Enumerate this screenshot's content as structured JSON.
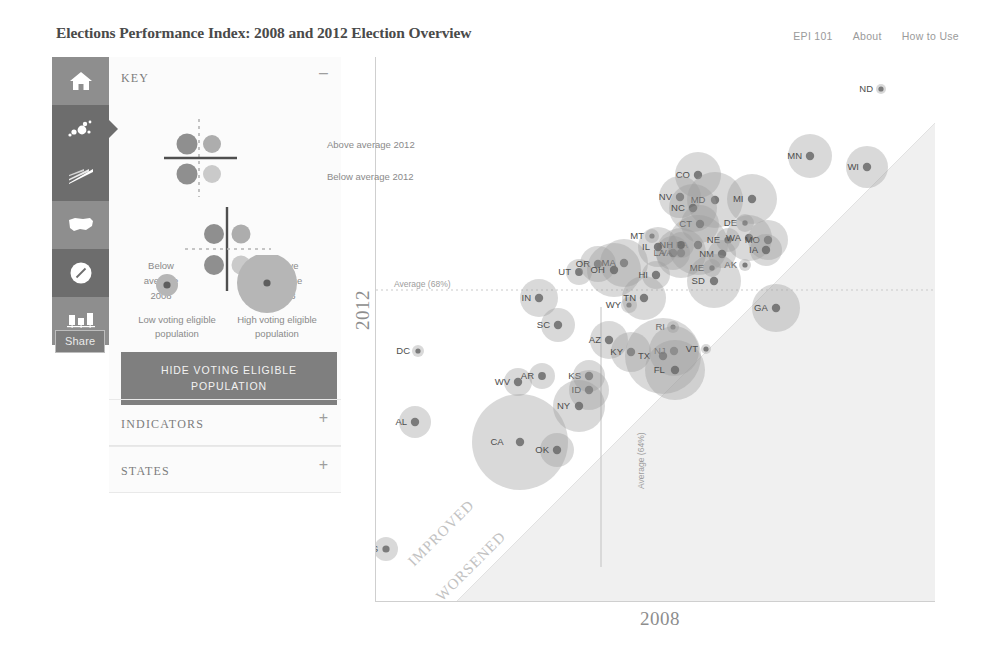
{
  "header": {
    "title": "Elections Performance Index: 2008 and 2012 Election Overview",
    "nav": [
      {
        "label": "EPI 101"
      },
      {
        "label": "About"
      },
      {
        "label": "How to Use"
      }
    ]
  },
  "sidebar": {
    "share_label": "Share",
    "items": [
      {
        "icon": "home-icon",
        "active": false
      },
      {
        "icon": "bubble-chart-icon",
        "active": true
      },
      {
        "icon": "slope-chart-icon",
        "active": true
      },
      {
        "icon": "us-map-icon",
        "active": false
      },
      {
        "icon": "dial-gauge-icon",
        "active": false
      },
      {
        "icon": "bar-chart-icon",
        "active": false
      }
    ]
  },
  "panel": {
    "key": {
      "title": "KEY",
      "toggle": "–",
      "quadrant_labels": {
        "above_2012": "Above average 2012",
        "below_2012": "Below average 2012",
        "below_2008": "Below average 2008",
        "above_2008": "Above average 2008"
      },
      "size_labels": {
        "low": "Low voting eligible population",
        "high": "High voting eligible population"
      },
      "hide_button": "HIDE VOTING ELIGIBLE POPULATION"
    },
    "indicators": {
      "title": "INDICATORS",
      "toggle": "+"
    },
    "states": {
      "title": "STATES",
      "toggle": "+"
    }
  },
  "chart_data": {
    "type": "scatter",
    "title": "Elections Performance Index: 2008 and 2012 Election Overview",
    "xlabel": "2008",
    "ylabel": "2012",
    "xlim": [
      40,
      100
    ],
    "ylim": [
      40,
      100
    ],
    "grid": false,
    "averages": {
      "x_label": "Average (64%)",
      "x_value": 64,
      "y_label": "Average (68%)",
      "y_value": 68
    },
    "annotations": [
      {
        "text": "IMPROVED",
        "position": "above-diagonal"
      },
      {
        "text": "WORSENED",
        "position": "below-diagonal"
      }
    ],
    "size_encoding": "voting eligible population",
    "colors": {
      "bubble_fill": "#9a9a9a",
      "bubble_core": "#6a6a6a",
      "axis": "#cfcfcf",
      "average_line": "#c9c9c9",
      "worsened_region": "#efefef",
      "panel_accent": "#7f7f7f"
    },
    "points": [
      {
        "label": "ND",
        "x": 880,
        "y": 89,
        "r": 5,
        "size": 1
      },
      {
        "label": "MN",
        "x": 809,
        "y": 156,
        "r": 22,
        "size": 5
      },
      {
        "label": "WI",
        "x": 866,
        "y": 167,
        "r": 21,
        "size": 5
      },
      {
        "label": "CO",
        "x": 697,
        "y": 175,
        "r": 23,
        "size": 5
      },
      {
        "label": "NV",
        "x": 679,
        "y": 197,
        "r": 21,
        "size": 4
      },
      {
        "label": "MD",
        "x": 714,
        "y": 200,
        "r": 28,
        "size": 6
      },
      {
        "label": "MI",
        "x": 751,
        "y": 199,
        "r": 25,
        "size": 6
      },
      {
        "label": "NC",
        "x": 692,
        "y": 208,
        "r": 24,
        "size": 6
      },
      {
        "label": "CT",
        "x": 699,
        "y": 224,
        "r": 19,
        "size": 4
      },
      {
        "label": "DE",
        "x": 744,
        "y": 223,
        "r": 9,
        "size": 2
      },
      {
        "label": "MT",
        "x": 651,
        "y": 236,
        "r": 7,
        "size": 1
      },
      {
        "label": "PA",
        "x": 697,
        "y": 245,
        "r": 30,
        "size": 7
      },
      {
        "label": "NE",
        "x": 727,
        "y": 240,
        "r": 12,
        "size": 3
      },
      {
        "label": "WA",
        "x": 748,
        "y": 238,
        "r": 23,
        "size": 5
      },
      {
        "label": "MO",
        "x": 767,
        "y": 240,
        "r": 20,
        "size": 5
      },
      {
        "label": "VA",
        "x": 680,
        "y": 253,
        "r": 25,
        "size": 6
      },
      {
        "label": "NM",
        "x": 721,
        "y": 254,
        "r": 14,
        "size": 3
      },
      {
        "label": "IA",
        "x": 765,
        "y": 250,
        "r": 16,
        "size": 4
      },
      {
        "label": "AK",
        "x": 744,
        "y": 265,
        "r": 6,
        "size": 1
      },
      {
        "label": "ME",
        "x": 711,
        "y": 268,
        "r": 9,
        "size": 2
      },
      {
        "label": "SD",
        "x": 713,
        "y": 281,
        "r": 27,
        "size": 6
      },
      {
        "label": "UT",
        "x": 578,
        "y": 272,
        "r": 13,
        "size": 3
      },
      {
        "label": "OR",
        "x": 597,
        "y": 264,
        "r": 18,
        "size": 4
      },
      {
        "label": "MA",
        "x": 623,
        "y": 263,
        "r": 24,
        "size": 6
      },
      {
        "label": "OH",
        "x": 613,
        "y": 270,
        "r": 27,
        "size": 6
      },
      {
        "label": "IN",
        "x": 538,
        "y": 298,
        "r": 19,
        "size": 4
      },
      {
        "label": "WY",
        "x": 628,
        "y": 305,
        "r": 8,
        "size": 2
      },
      {
        "label": "TN",
        "x": 643,
        "y": 298,
        "r": 22,
        "size": 5
      },
      {
        "label": "GA",
        "x": 775,
        "y": 308,
        "r": 24,
        "size": 6
      },
      {
        "label": "SC",
        "x": 557,
        "y": 325,
        "r": 17,
        "size": 4
      },
      {
        "label": "RI",
        "x": 672,
        "y": 327,
        "r": 6,
        "size": 1
      },
      {
        "label": "AZ",
        "x": 608,
        "y": 340,
        "r": 19,
        "size": 4
      },
      {
        "label": "KY",
        "x": 630,
        "y": 352,
        "r": 20,
        "size": 5
      },
      {
        "label": "NJ",
        "x": 673,
        "y": 351,
        "r": 25,
        "size": 6
      },
      {
        "label": "TX",
        "x": 662,
        "y": 356,
        "r": 38,
        "size": 9
      },
      {
        "label": "FL",
        "x": 674,
        "y": 370,
        "r": 30,
        "size": 7
      },
      {
        "label": "VT",
        "x": 705,
        "y": 349,
        "r": 5,
        "size": 1
      },
      {
        "label": "DC",
        "x": 417,
        "y": 351,
        "r": 6,
        "size": 1
      },
      {
        "label": "WV",
        "x": 517,
        "y": 382,
        "r": 14,
        "size": 3
      },
      {
        "label": "AR",
        "x": 541,
        "y": 376,
        "r": 13,
        "size": 3
      },
      {
        "label": "KS",
        "x": 588,
        "y": 376,
        "r": 16,
        "size": 4
      },
      {
        "label": "ID",
        "x": 588,
        "y": 390,
        "r": 20,
        "size": 4
      },
      {
        "label": "NY",
        "x": 578,
        "y": 406,
        "r": 26,
        "size": 6
      },
      {
        "label": "AL",
        "x": 414,
        "y": 422,
        "r": 16,
        "size": 4
      },
      {
        "label": "CA",
        "x": 519,
        "y": 442,
        "r": 48,
        "size": 10
      },
      {
        "label": "OK",
        "x": 556,
        "y": 450,
        "r": 17,
        "size": 4
      },
      {
        "label": "MS",
        "x": 385,
        "y": 549,
        "r": 12,
        "size": 3
      },
      {
        "label": "LA",
        "x": 672,
        "y": 253,
        "r": 17,
        "size": 4
      },
      {
        "label": "NH",
        "x": 680,
        "y": 245,
        "r": 13,
        "size": 3
      },
      {
        "label": "IL",
        "x": 657,
        "y": 247,
        "r": 20,
        "size": 5
      },
      {
        "label": "HI",
        "x": 655,
        "y": 275,
        "r": 14,
        "size": 3
      }
    ]
  }
}
